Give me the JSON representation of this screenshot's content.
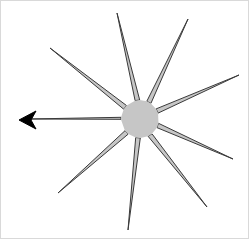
{
  "figure": {
    "title": "Nine-spoke star burst with arrow marker",
    "type": "vector-shape-diagram",
    "canvas": {
      "width": 249,
      "height": 239
    },
    "background_color": "#ffffff",
    "frame_color": "#d9d9d9"
  },
  "style": {
    "fill_color": "#c6c6c6",
    "stroke_color": "#3a3a3a",
    "stroke_width": 1,
    "arrow_color": "#000000"
  },
  "center": {
    "x": 139,
    "y": 118,
    "hub_radius": 15
  },
  "spokes": [
    {
      "name": "spoke-north",
      "label": "N",
      "angle_deg": 98,
      "tip_x": 116,
      "tip_y": 12,
      "length": 109,
      "half_width_deg": 7,
      "arrow": false
    },
    {
      "name": "spoke-northeast",
      "label": "NE",
      "angle_deg": 62,
      "tip_x": 187,
      "tip_y": 18,
      "length": 109,
      "half_width_deg": 7,
      "arrow": false
    },
    {
      "name": "spoke-east-upper",
      "label": "ENE",
      "angle_deg": 25,
      "tip_x": 238,
      "tip_y": 74,
      "length": 108,
      "half_width_deg": 7,
      "arrow": false
    },
    {
      "name": "spoke-east-lower",
      "label": "ESE",
      "angle_deg": -20,
      "tip_x": 232,
      "tip_y": 158,
      "length": 100,
      "half_width_deg": 7,
      "arrow": false
    },
    {
      "name": "spoke-southeast",
      "label": "SE",
      "angle_deg": -58,
      "tip_x": 206,
      "tip_y": 206,
      "length": 110,
      "half_width_deg": 7,
      "arrow": false
    },
    {
      "name": "spoke-south",
      "label": "S",
      "angle_deg": -96,
      "tip_x": 127,
      "tip_y": 229,
      "length": 112,
      "half_width_deg": 7,
      "arrow": false
    },
    {
      "name": "spoke-southwest",
      "label": "SW",
      "angle_deg": -135,
      "tip_x": 57,
      "tip_y": 192,
      "length": 110,
      "half_width_deg": 7,
      "arrow": false
    },
    {
      "name": "spoke-west",
      "label": "W",
      "angle_deg": 178,
      "tip_x": 27,
      "tip_y": 118,
      "length": 112,
      "half_width_deg": 3,
      "arrow": true
    },
    {
      "name": "spoke-northwest",
      "label": "NW",
      "angle_deg": 142,
      "tip_x": 49,
      "tip_y": 47,
      "length": 114,
      "half_width_deg": 7,
      "arrow": false
    }
  ],
  "arrow_marker": {
    "name": "arrowhead-west",
    "tip_x": 18,
    "tip_y": 119,
    "back_x": 35,
    "half_height": 9,
    "notch": 5,
    "color": "#000000"
  },
  "counts": {
    "spoke_count": 9,
    "arrow_count": 1
  }
}
